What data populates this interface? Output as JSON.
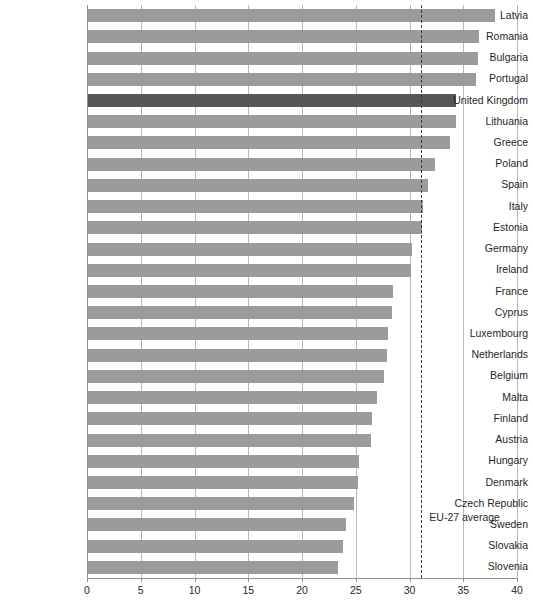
{
  "chart_data": {
    "type": "bar",
    "orientation": "horizontal",
    "title": "",
    "subtitle": "",
    "xlabel": "",
    "ylabel": "",
    "xlim": [
      0,
      40
    ],
    "xticks": [
      0,
      5,
      10,
      15,
      20,
      25,
      30,
      35,
      40
    ],
    "xtick_labels": [
      "0",
      "5",
      "10",
      "15",
      "20",
      "25",
      "30",
      "35",
      "40"
    ],
    "grid": "vertical",
    "legend": "none",
    "categories": [
      "Latvia",
      "Romania",
      "Bulgaria",
      "Portugal",
      "United Kingdom",
      "Lithuania",
      "Greece",
      "Poland",
      "Spain",
      "Italy",
      "Estonia",
      "Germany",
      "Ireland",
      "France",
      "Cyprus",
      "Luxembourg",
      "Netherlands",
      "Belgium",
      "Malta",
      "Finland",
      "Austria",
      "Hungary",
      "Denmark",
      "Czech Republic",
      "Sweden",
      "Slovakia",
      "Slovenia"
    ],
    "values": [
      37.9,
      36.4,
      36.3,
      36.1,
      34.2,
      34.2,
      33.7,
      32.3,
      31.6,
      31.2,
      31.1,
      30.1,
      30.0,
      28.4,
      28.3,
      27.9,
      27.8,
      27.5,
      26.9,
      26.4,
      26.3,
      25.2,
      25.1,
      24.7,
      24.0,
      23.7,
      23.3
    ],
    "highlight_category": "United Kingdom",
    "annotations": [
      {
        "name": "eu-average-line",
        "label": "EU-27 average",
        "value": 31.1,
        "style": "dashed-vertical"
      }
    ],
    "colors": {
      "bar": "#9b9b9b",
      "bar_highlight": "#565656",
      "gridline": "#b9b9b9",
      "axis": "#8f8f8f",
      "annotation_line": "#3a3a3a",
      "text": "#1f1f1f",
      "background": "#ffffff"
    }
  }
}
